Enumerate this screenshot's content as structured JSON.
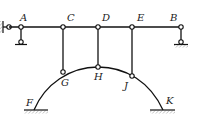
{
  "diagram": {
    "type": "structural-frame-with-arch",
    "labels": {
      "A": "A",
      "B": "B",
      "C": "C",
      "D": "D",
      "E": "E",
      "F": "F",
      "G": "G",
      "H": "H",
      "J": "J",
      "K": "K"
    },
    "nodes": [
      {
        "id": "A",
        "x": 21,
        "y": 27
      },
      {
        "id": "C",
        "x": 63,
        "y": 27
      },
      {
        "id": "D",
        "x": 98,
        "y": 27
      },
      {
        "id": "E",
        "x": 132,
        "y": 27
      },
      {
        "id": "B",
        "x": 181,
        "y": 27
      },
      {
        "id": "G",
        "x": 63,
        "y": 72
      },
      {
        "id": "H",
        "x": 98,
        "y": 67
      },
      {
        "id": "J",
        "x": 132,
        "y": 76
      },
      {
        "id": "F",
        "x": 34,
        "y": 110
      },
      {
        "id": "K",
        "x": 163,
        "y": 110
      }
    ],
    "members": [
      {
        "from": "A",
        "to": "B",
        "kind": "beam"
      },
      {
        "from": "C",
        "to": "G",
        "kind": "link"
      },
      {
        "from": "D",
        "to": "H",
        "kind": "link"
      },
      {
        "from": "E",
        "to": "J",
        "kind": "link"
      },
      {
        "from": "F",
        "to": "K",
        "kind": "arch"
      }
    ],
    "supports": [
      {
        "at": "A",
        "kind": "horizontal link to wall + vertical link to ground"
      },
      {
        "at": "B",
        "kind": "vertical link to ground"
      },
      {
        "at": "F",
        "kind": "fixed"
      },
      {
        "at": "K",
        "kind": "fixed"
      }
    ]
  }
}
